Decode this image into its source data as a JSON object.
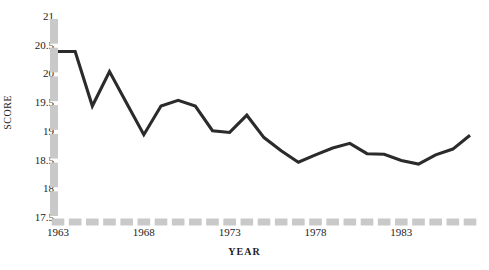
{
  "chart_data": {
    "type": "line",
    "title": "",
    "xlabel": "YEAR",
    "ylabel": "SCORE",
    "xlim": [
      1963,
      1987
    ],
    "ylim": [
      17.5,
      21
    ],
    "grid": false,
    "legend": null,
    "series_color": "#2b2b2b",
    "axis_color": "#c9c9c9",
    "x": [
      1963,
      1964,
      1965,
      1966,
      1967,
      1968,
      1969,
      1970,
      1971,
      1972,
      1973,
      1974,
      1975,
      1976,
      1977,
      1978,
      1979,
      1980,
      1981,
      1982,
      1983,
      1984,
      1985,
      1986,
      1987
    ],
    "values": [
      20.4,
      20.4,
      19.45,
      20.05,
      19.5,
      18.95,
      19.45,
      19.55,
      19.45,
      19.02,
      18.99,
      19.29,
      18.9,
      18.67,
      18.47,
      18.6,
      18.72,
      18.8,
      18.62,
      18.61,
      18.5,
      18.44,
      18.6,
      18.7,
      18.94
    ],
    "series": [
      {
        "name": "SCORE",
        "values": [
          20.4,
          20.4,
          19.45,
          20.05,
          19.5,
          18.95,
          19.45,
          19.55,
          19.45,
          19.02,
          18.99,
          19.29,
          18.9,
          18.67,
          18.47,
          18.6,
          18.72,
          18.8,
          18.62,
          18.61,
          18.5,
          18.44,
          18.6,
          18.7,
          18.94
        ]
      }
    ],
    "ytick_labels": [
      "21",
      "20.5",
      "20",
      "19.5",
      "19",
      "18.5",
      "18",
      "17.5"
    ],
    "ytick_values": [
      21,
      20.5,
      20,
      19.5,
      19,
      18.5,
      18,
      17.5
    ],
    "xtick_labels": [
      "1963",
      "1968",
      "1973",
      "1978",
      "1983"
    ],
    "xtick_values": [
      1963,
      1968,
      1973,
      1978,
      1983
    ]
  }
}
